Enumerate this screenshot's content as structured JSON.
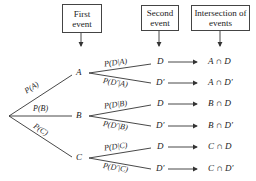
{
  "headers": {
    "first_event": "First event",
    "second_event": "Second event",
    "intersection": "Intersection of events"
  },
  "first_level": {
    "branches": [
      {
        "node": "A",
        "prob": "P(A)"
      },
      {
        "node": "B",
        "prob": "P(B)"
      },
      {
        "node": "C",
        "prob": "P(C)"
      }
    ]
  },
  "second_level": [
    {
      "parent": "A",
      "outcomes": [
        {
          "event": "D",
          "prob": "P(D|A)",
          "intersection": "A ∩ D"
        },
        {
          "event": "D′",
          "prob": "P(D′|A)",
          "intersection": "A ∩ D′"
        }
      ]
    },
    {
      "parent": "B",
      "outcomes": [
        {
          "event": "D",
          "prob": "P(D|B)",
          "intersection": "B ∩ D"
        },
        {
          "event": "D′",
          "prob": "P(D′|B)",
          "intersection": "B ∩ D′"
        }
      ]
    },
    {
      "parent": "C",
      "outcomes": [
        {
          "event": "D",
          "prob": "P(D|C)",
          "intersection": "C ∩ D"
        },
        {
          "event": "D′",
          "prob": "P(D′|C)",
          "intersection": "C ∩ D′"
        }
      ]
    }
  ],
  "colors": {
    "line": "#333333",
    "text": "#222222",
    "background": "#ffffff"
  }
}
